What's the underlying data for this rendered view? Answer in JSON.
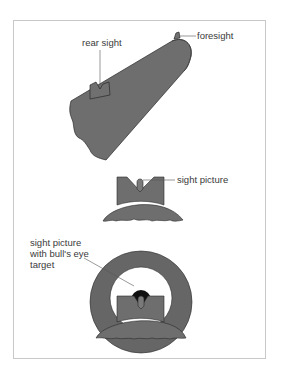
{
  "diagram": {
    "labels": {
      "rear_sight": "rear sight",
      "foresight": "foresight",
      "sight_picture": "sight picture",
      "bulls_eye_line1": "sight picture",
      "bulls_eye_line2": "with bull's eye",
      "bulls_eye_line3": "target"
    },
    "colors": {
      "fill_gray": "#6e6e6e",
      "ring_gray": "#666666",
      "outline": "#2a2a2a",
      "bull": "#111111",
      "leader": "#555555",
      "frame_border": "#c8c8c8"
    }
  }
}
